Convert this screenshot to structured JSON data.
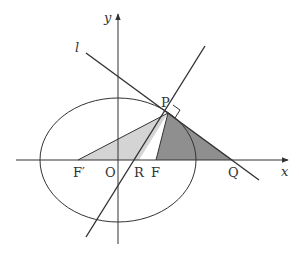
{
  "diagram": {
    "type": "geometry",
    "axes": {
      "x_label": "x",
      "y_label": "y",
      "origin_label": "O"
    },
    "labels": {
      "line_l": "l",
      "P": "P",
      "F_prime": "F′",
      "O": "O",
      "R": "R",
      "F": "F",
      "Q": "Q"
    },
    "colors": {
      "stroke": "#333333",
      "light_shade": "#d4d4d4",
      "dark_shade": "#8f8f8f",
      "background": "#ffffff"
    },
    "points_px": {
      "P": [
        168,
        113
      ],
      "F_prime": [
        78,
        160
      ],
      "O": [
        118,
        160
      ],
      "R": [
        139,
        160
      ],
      "F": [
        156,
        160
      ],
      "Q": [
        233,
        160
      ]
    },
    "ellipse_px": {
      "cx": 118,
      "cy": 160,
      "rx": 78,
      "ry": 62
    },
    "right_angle_marker_at": "P"
  }
}
